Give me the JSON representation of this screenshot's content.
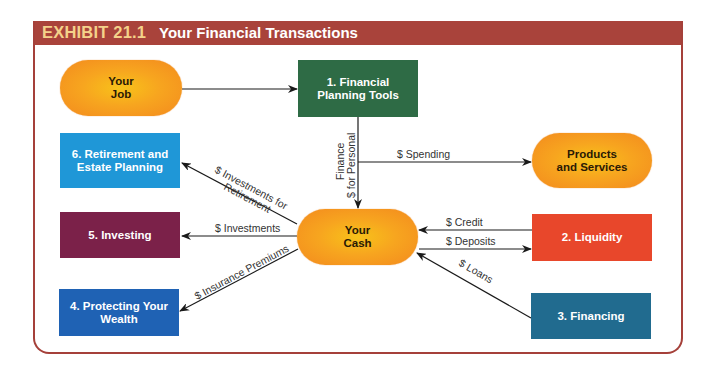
{
  "exhibit": {
    "number": "EXHIBIT 21.1",
    "title": "Your Financial Transactions",
    "header_color": "#a9433b",
    "number_color": "#f4d28a"
  },
  "nodes": {
    "your_job": {
      "line1": "Your",
      "line2": "Job"
    },
    "financial_planning": {
      "line1": "1. Financial",
      "line2": "Planning Tools",
      "color": "#2e6b45"
    },
    "products_services": {
      "line1": "Products",
      "line2": "and Services"
    },
    "your_cash": {
      "line1": "Your",
      "line2": "Cash"
    },
    "liquidity": {
      "line1": "2. Liquidity",
      "color": "#e8472b"
    },
    "financing": {
      "line1": "3. Financing",
      "color": "#216b8f"
    },
    "protecting": {
      "line1": "4. Protecting Your",
      "line2": "Wealth",
      "color": "#1f62b4"
    },
    "investing": {
      "line1": "5. Investing",
      "color": "#7b2149"
    },
    "retirement": {
      "line1": "6. Retirement and",
      "line2": "Estate Planning",
      "color": "#1f97d7"
    }
  },
  "flows": {
    "personal_finance": {
      "line1": "$ for Personal",
      "line2": "Finance"
    },
    "spending": "$ Spending",
    "investments_retirement": {
      "line1": "$ Investments for",
      "line2": "Retirement"
    },
    "investments": "$ Investments",
    "insurance": "$ Insurance Premiums",
    "credit": "$ Credit",
    "deposits": "$ Deposits",
    "loans": "$ Loans"
  }
}
